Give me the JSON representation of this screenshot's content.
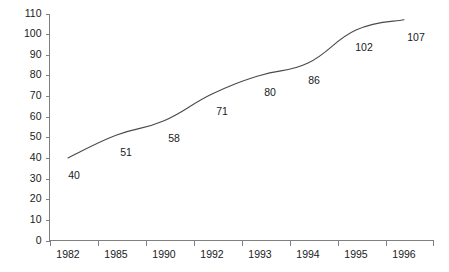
{
  "chart_data": {
    "type": "line",
    "title": "",
    "subtitle": "",
    "xlabel": "",
    "ylabel": "",
    "categories": [
      "1982",
      "1985",
      "1990",
      "1992",
      "1993",
      "1994",
      "1995",
      "1996"
    ],
    "values": [
      40,
      51,
      58,
      71,
      80,
      86,
      102,
      107
    ],
    "point_labels": [
      "40",
      "51",
      "58",
      "71",
      "80",
      "86",
      "102",
      "107"
    ],
    "ylim": [
      0,
      110
    ],
    "ytick_labels": [
      "110",
      "100",
      "90",
      "80",
      "70",
      "60",
      "50",
      "40",
      "30",
      "20",
      "10",
      "0"
    ],
    "ytick_values": [
      110,
      100,
      90,
      80,
      70,
      60,
      50,
      40,
      30,
      20,
      10,
      0
    ],
    "ytick_step": 10,
    "grid": false,
    "legend": null,
    "legend_position": "none",
    "annotations": [],
    "series": [
      {
        "name": "",
        "values": [
          40,
          51,
          58,
          71,
          80,
          86,
          102,
          107
        ]
      }
    ],
    "colors": {
      "line": "#4a4a4a",
      "axis": "#808080",
      "text": "#1a1a1a",
      "background": "#ffffff"
    }
  }
}
